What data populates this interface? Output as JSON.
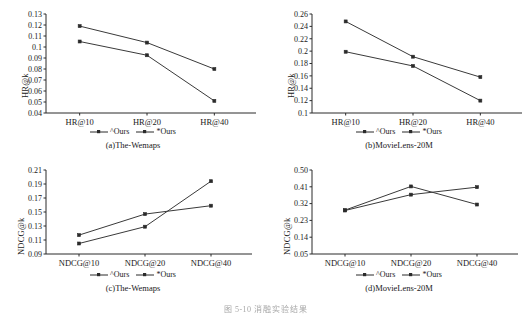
{
  "figure": {
    "caption_number": "图 5-10",
    "caption_text": "消融实验结果",
    "legend_labels": [
      "^Ours",
      "*Ours"
    ]
  },
  "chart_data": [
    {
      "type": "line",
      "panel": "a",
      "title": "(a)The-Wemaps",
      "xlabel": "",
      "ylabel": "HR@k",
      "categories": [
        "HR@10",
        "HR@20",
        "HR@40"
      ],
      "yticks": [
        0.04,
        0.05,
        0.06,
        0.07,
        0.08,
        0.09,
        0.1,
        0.11,
        0.12,
        0.13
      ],
      "ytick_labels": [
        "0.04",
        "0.05",
        "0.06",
        "0.07",
        "0.08",
        "0.09",
        "0.1",
        "0.11",
        "0.12",
        "0.13"
      ],
      "ylim": [
        0.04,
        0.13
      ],
      "grid": false,
      "legend_position": "below-axis",
      "series": [
        {
          "name": "^Ours",
          "values": [
            0.105,
            0.0925,
            0.051
          ]
        },
        {
          "name": "*Ours",
          "values": [
            0.119,
            0.104,
            0.08
          ]
        }
      ]
    },
    {
      "type": "line",
      "panel": "b",
      "title": "(b)MovieLens-20M",
      "xlabel": "",
      "ylabel": "HR@k",
      "categories": [
        "HR@10",
        "HR@20",
        "HR@40"
      ],
      "yticks": [
        0.1,
        0.12,
        0.14,
        0.16,
        0.18,
        0.2,
        0.22,
        0.24,
        0.26
      ],
      "ytick_labels": [
        "0.1",
        "0.12",
        "0.14",
        "0.16",
        "0.18",
        "0.2",
        "0.22",
        "0.24",
        "0.26"
      ],
      "ylim": [
        0.1,
        0.26
      ],
      "grid": false,
      "legend_position": "below-axis",
      "series": [
        {
          "name": "^Ours",
          "values": [
            0.199,
            0.176,
            0.12
          ]
        },
        {
          "name": "*Ours",
          "values": [
            0.248,
            0.191,
            0.158
          ]
        }
      ]
    },
    {
      "type": "line",
      "panel": "c",
      "title": "(c)The-Wemaps",
      "xlabel": "",
      "ylabel": "NDCG@k",
      "categories": [
        "NDCG@10",
        "NDCG@20",
        "NDCG@40"
      ],
      "yticks": [
        0.09,
        0.11,
        0.13,
        0.15,
        0.17,
        0.19,
        0.21
      ],
      "ytick_labels": [
        "0.09",
        "0.11",
        "0.13",
        "0.15",
        "0.17",
        "0.19",
        "0.21"
      ],
      "ylim": [
        0.09,
        0.21
      ],
      "grid": false,
      "legend_position": "below-axis",
      "series": [
        {
          "name": "^Ours",
          "values": [
            0.117,
            0.147,
            0.159
          ]
        },
        {
          "name": "*Ours",
          "values": [
            0.105,
            0.129,
            0.194
          ]
        }
      ]
    },
    {
      "type": "line",
      "panel": "d",
      "title": "(d)MovieLens-20M",
      "xlabel": "",
      "ylabel": "NDCG@k",
      "categories": [
        "NDCG@10",
        "NDCG@20",
        "NDCG@40"
      ],
      "yticks": [
        0.05,
        0.14,
        0.23,
        0.32,
        0.41,
        0.5
      ],
      "ytick_labels": [
        "0.05",
        "0.14",
        "0.23",
        "0.32",
        "0.41",
        "0.50"
      ],
      "ylim": [
        0.05,
        0.5
      ],
      "grid": false,
      "legend_position": "below-axis",
      "series": [
        {
          "name": "^Ours",
          "values": [
            0.285,
            0.412,
            0.315
          ]
        },
        {
          "name": "*Ours",
          "values": [
            0.283,
            0.368,
            0.408
          ]
        }
      ]
    }
  ]
}
